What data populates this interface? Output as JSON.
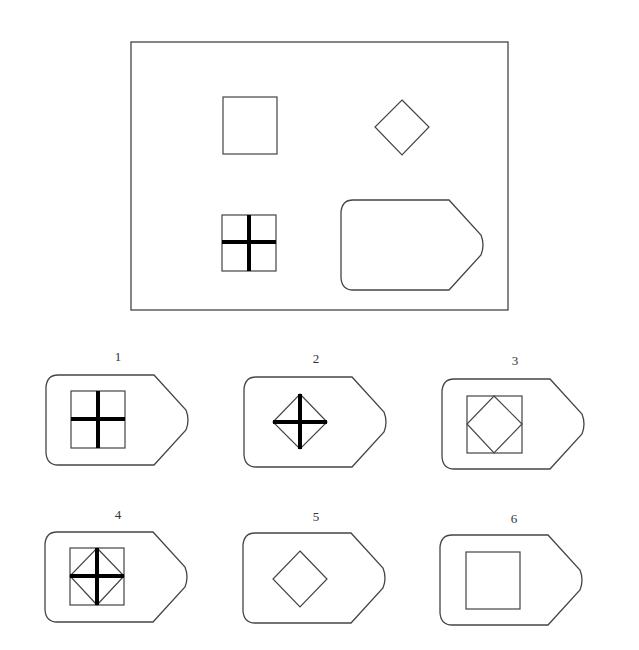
{
  "puzzle": {
    "question_panel": {
      "frame": {
        "x": 131,
        "y": 42,
        "w": 377,
        "h": 268
      },
      "cells": [
        {
          "shape": "square",
          "x": 223,
          "y": 97,
          "size": 54
        },
        {
          "shape": "diamond",
          "cx": 402,
          "cy": 127,
          "half": 27
        },
        {
          "shape": "square-with-cross",
          "x": 222,
          "y": 215,
          "size": 55
        },
        {
          "shape": "tag",
          "x": 339,
          "y": 200,
          "w": 145,
          "h": 89
        }
      ]
    },
    "options": [
      {
        "label": "1",
        "tag": {
          "x": 44,
          "y": 375
        },
        "content": "square-with-cross",
        "label_pos": {
          "x": 118,
          "y": 355
        }
      },
      {
        "label": "2",
        "tag": {
          "x": 242,
          "y": 377
        },
        "content": "diamond-with-cross",
        "label_pos": {
          "x": 316,
          "y": 356
        }
      },
      {
        "label": "3",
        "tag": {
          "x": 440,
          "y": 379
        },
        "content": "square-with-inscribed-diamond",
        "label_pos": {
          "x": 515,
          "y": 358
        }
      },
      {
        "label": "4",
        "tag": {
          "x": 43,
          "y": 532
        },
        "content": "square-diamond-cross",
        "label_pos": {
          "x": 118,
          "y": 512
        }
      },
      {
        "label": "5",
        "tag": {
          "x": 241,
          "y": 533
        },
        "content": "diamond",
        "label_pos": {
          "x": 316,
          "y": 513
        }
      },
      {
        "label": "6",
        "tag": {
          "x": 438,
          "y": 535
        },
        "content": "square",
        "label_pos": {
          "x": 514,
          "y": 515
        }
      }
    ],
    "colors": {
      "stroke": "#444444",
      "thick": "#000000",
      "background": "#ffffff"
    }
  }
}
